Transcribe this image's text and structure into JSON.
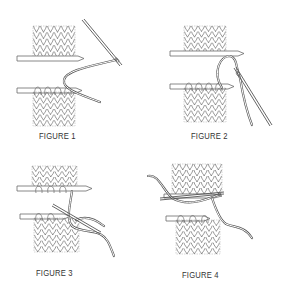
{
  "diagram": {
    "figures": [
      {
        "id": 1,
        "caption": "FIGURE 1"
      },
      {
        "id": 2,
        "caption": "FIGURE 2"
      },
      {
        "id": 3,
        "caption": "FIGURE 3"
      },
      {
        "id": 4,
        "caption": "FIGURE 4"
      }
    ],
    "colors": {
      "line": "#6a6a6a",
      "yarn": "#555555",
      "background": "#ffffff",
      "caption": "#333333"
    }
  }
}
